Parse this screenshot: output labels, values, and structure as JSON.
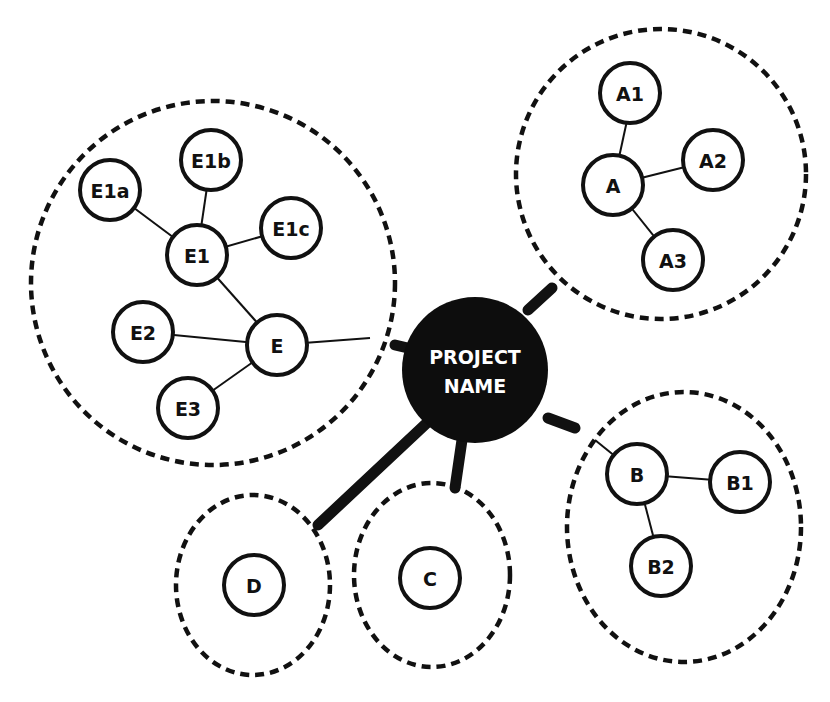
{
  "diagram": {
    "type": "mind-map",
    "center": {
      "line1": "PROJECT",
      "line2": "NAME"
    },
    "clusters": [
      {
        "id": "E",
        "nodes": [
          "E",
          "E1",
          "E1a",
          "E1b",
          "E1c",
          "E2",
          "E3"
        ]
      },
      {
        "id": "A",
        "nodes": [
          "A",
          "A1",
          "A2",
          "A3"
        ]
      },
      {
        "id": "B",
        "nodes": [
          "B",
          "B1",
          "B2"
        ]
      },
      {
        "id": "C",
        "nodes": [
          "C"
        ]
      },
      {
        "id": "D",
        "nodes": [
          "D"
        ]
      }
    ],
    "nodes": {
      "E": "E",
      "E1": "E1",
      "E1a": "E1a",
      "E1b": "E1b",
      "E1c": "E1c",
      "E2": "E2",
      "E3": "E3",
      "A": "A",
      "A1": "A1",
      "A2": "A2",
      "A3": "A3",
      "B": "B",
      "B1": "B1",
      "B2": "B2",
      "C": "C",
      "D": "D"
    },
    "edges": [
      [
        "PROJECT NAME",
        "E"
      ],
      [
        "PROJECT NAME",
        "A"
      ],
      [
        "PROJECT NAME",
        "B"
      ],
      [
        "PROJECT NAME",
        "C"
      ],
      [
        "PROJECT NAME",
        "D"
      ],
      [
        "E",
        "E1"
      ],
      [
        "E",
        "E2"
      ],
      [
        "E",
        "E3"
      ],
      [
        "E1",
        "E1a"
      ],
      [
        "E1",
        "E1b"
      ],
      [
        "E1",
        "E1c"
      ],
      [
        "A",
        "A1"
      ],
      [
        "A",
        "A2"
      ],
      [
        "A",
        "A3"
      ],
      [
        "B",
        "B1"
      ],
      [
        "B",
        "B2"
      ]
    ]
  }
}
